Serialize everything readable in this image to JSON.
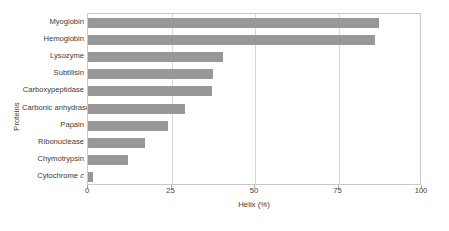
{
  "chart_data": {
    "type": "bar",
    "orientation": "horizontal",
    "title": "",
    "xlabel": "Helix (%)",
    "ylabel": "Proteins",
    "xlim": [
      0,
      100
    ],
    "xticks": [
      0,
      25,
      50,
      75,
      100
    ],
    "xticklabels": [
      "0",
      "25",
      "50",
      "75",
      "100"
    ],
    "gridlines": {
      "vertical_at": [
        25,
        50,
        75
      ],
      "horizontal": false
    },
    "legend": null,
    "bar_color": "#989898",
    "grid_color": "#d8d8d8",
    "frame_color": "#c9c9c9",
    "categories": [
      "Myoglobin",
      "Hemoglobin",
      "Lysozyme",
      "Subtilisin",
      "Carboxypeptidase",
      "Carbonic anhydrase",
      "Papain",
      "Ribonuclease",
      "Chymotrypsin",
      "Cytochrome c"
    ],
    "category_labels_html": [
      "Myoglobin",
      "Hemoglobin",
      "Lysozyme",
      "Subtilisin",
      "Carboxypeptidase",
      "Carbonic anhydrase",
      "Papain",
      "Ribonuclease",
      "Chymotrypsin",
      "Cytochrome <i>c</i>"
    ],
    "values": [
      87,
      86,
      40.5,
      37.5,
      37,
      29,
      24,
      17,
      12,
      1.5
    ]
  }
}
